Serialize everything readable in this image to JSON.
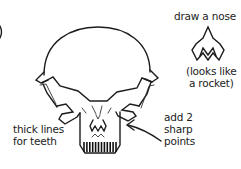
{
  "diagram": {
    "annotations": {
      "nose_instruction": "draw a nose",
      "nose_note": [
        "(looks like",
        "a rocket)"
      ],
      "teeth_instruction": [
        "thick lines",
        "for teeth"
      ],
      "points_instruction": [
        "add 2",
        "sharp",
        "points"
      ]
    },
    "parts": [
      "cranium",
      "brow-ridge",
      "cheekbones",
      "nose",
      "jaw",
      "teeth",
      "arrow"
    ],
    "teeth_count": 12,
    "colors": {
      "ink": "#1c1c1c",
      "background": "#ffffff"
    }
  }
}
